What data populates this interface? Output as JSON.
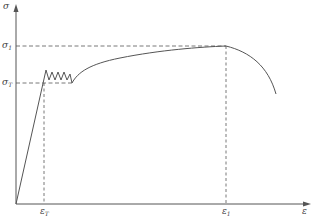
{
  "diagram": {
    "type": "stress-strain curve",
    "labels": {
      "y_axis": "σ",
      "x_axis": "ε",
      "sigma_1": {
        "base": "σ",
        "sub": "1"
      },
      "sigma_T": {
        "base": "σ",
        "sub": "T"
      },
      "eps_T": {
        "base": "ε",
        "sub": "T"
      },
      "eps_1": {
        "base": "ε",
        "sub": "1"
      }
    },
    "colors": {
      "curve": "#555555",
      "axis": "#555555",
      "dashed": "#555555"
    }
  }
}
